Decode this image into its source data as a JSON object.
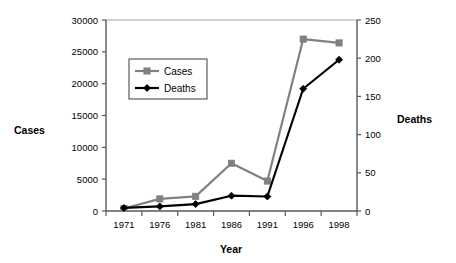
{
  "chart_data": {
    "type": "line",
    "title": "",
    "xlabel": "Year",
    "ylabel": "Cases",
    "y2label": "Deaths",
    "categories": [
      "1971",
      "1976",
      "1981",
      "1986",
      "1991",
      "1996",
      "1998"
    ],
    "ylim": [
      0,
      30000
    ],
    "y2lim": [
      0,
      250
    ],
    "yticks": [
      "0",
      "5000",
      "10000",
      "15000",
      "20000",
      "25000",
      "30000"
    ],
    "ytick_values": [
      0,
      5000,
      10000,
      15000,
      20000,
      25000,
      30000
    ],
    "y2ticks": [
      "0",
      "50",
      "100",
      "150",
      "200",
      "250"
    ],
    "y2tick_values": [
      0,
      50,
      100,
      150,
      200,
      250
    ],
    "grid": false,
    "legend_position": "upper-left-inside",
    "series": [
      {
        "name": "Cases",
        "axis": "left",
        "color": "#808080",
        "marker": "square",
        "values": [
          400,
          1900,
          2300,
          7500,
          4700,
          27000,
          26400
        ]
      },
      {
        "name": "Deaths",
        "axis": "right",
        "color": "#000000",
        "marker": "diamond",
        "values": [
          4,
          6,
          9,
          20,
          19,
          160,
          198
        ]
      }
    ],
    "legend": [
      {
        "label": "Cases",
        "color": "#808080",
        "marker": "square"
      },
      {
        "label": "Deaths",
        "color": "#000000",
        "marker": "diamond"
      }
    ]
  },
  "axes": {
    "left_title": "Cases",
    "right_title": "Deaths",
    "bottom_title": "Year"
  },
  "colors": {
    "cases": "#808080",
    "deaths": "#000000",
    "axis": "#595959",
    "frame_top": "#bfbfbf",
    "background": "#ffffff"
  }
}
